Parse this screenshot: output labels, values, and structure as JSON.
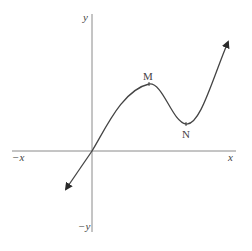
{
  "diagram": {
    "type": "function-graph",
    "axes": {
      "x_positive_label": "x",
      "x_negative_label": "−x",
      "y_positive_label": "y",
      "y_negative_label": "−y",
      "axis_color": "#8a8a8a"
    },
    "curve": {
      "description": "Cubic-like curve passing through origin with local maximum M and local minimum N, arrows on both ends",
      "color": "#444444"
    },
    "points": [
      {
        "label": "M",
        "role": "local maximum"
      },
      {
        "label": "N",
        "role": "local minimum"
      }
    ]
  }
}
